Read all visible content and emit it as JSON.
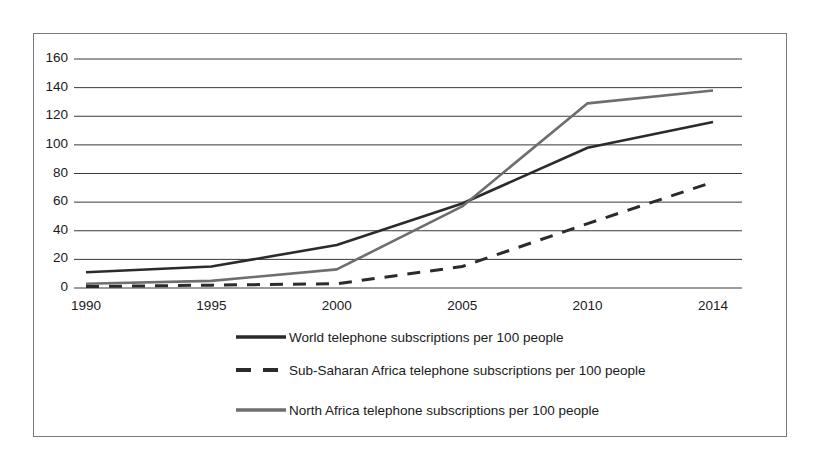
{
  "chart_data": {
    "type": "line",
    "title": "",
    "subtitle": "",
    "xlabel": "",
    "ylabel": "",
    "x": [
      1990,
      1995,
      2000,
      2005,
      2010,
      2014
    ],
    "categories": [
      "1990",
      "1995",
      "2000",
      "2005",
      "2010",
      "2014"
    ],
    "xlim": [
      1990,
      2014
    ],
    "ylim": [
      0,
      160
    ],
    "y_ticks": [
      0,
      20,
      40,
      60,
      80,
      100,
      120,
      140,
      160
    ],
    "y_tick_labels": [
      "0",
      "20",
      "40",
      "60",
      "80",
      "100",
      "120",
      "140",
      "160"
    ],
    "x_tick_labels": [
      "1990",
      "1995",
      "2000",
      "2005",
      "2010",
      "2014"
    ],
    "grid": "horizontal",
    "legend_position": "below",
    "series": [
      {
        "name": "World telephone subscriptions per 100 people",
        "values": [
          11,
          15,
          30,
          59,
          98,
          116
        ],
        "color": "#2b2b2b",
        "style": "solid",
        "width": 2.6
      },
      {
        "name": "Sub-Saharan Africa telephone subscriptions per 100 people",
        "values": [
          1,
          2,
          3,
          15,
          45,
          74
        ],
        "color": "#2b2b2b",
        "style": "dashed",
        "width": 3.0
      },
      {
        "name": "North Africa telephone subscriptions per 100 people",
        "values": [
          3,
          5,
          13,
          57,
          129,
          138
        ],
        "color": "#6e6e6e",
        "style": "solid",
        "width": 2.6
      }
    ]
  },
  "legend": {
    "items": [
      {
        "label": "World telephone subscriptions per 100 people"
      },
      {
        "label": "Sub-Saharan Africa telephone subscriptions per 100 people"
      },
      {
        "label": "North Africa telephone subscriptions per 100 people"
      }
    ]
  },
  "axis": {
    "y_labels": [
      "160",
      "140",
      "120",
      "100",
      "80",
      "60",
      "40",
      "20",
      "0"
    ],
    "x_labels": [
      "1990",
      "1995",
      "2000",
      "2005",
      "2010",
      "2014"
    ]
  },
  "colors": {
    "frame": "#7a7a7a",
    "grid": "#3a3a3a",
    "text": "#1a1a1a",
    "series_world": "#2b2b2b",
    "series_subsaharan": "#2b2b2b",
    "series_north_africa": "#6e6e6e",
    "background": "#ffffff"
  }
}
